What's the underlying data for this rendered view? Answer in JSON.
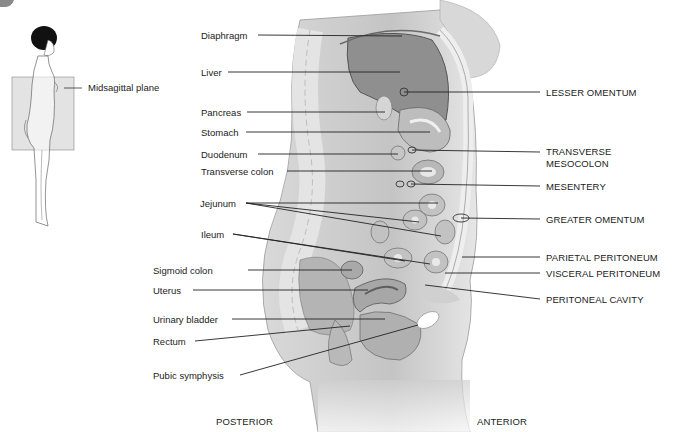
{
  "inset": {
    "label": "Midsagittal plane",
    "plane_color": "#e3e3e3"
  },
  "left_labels": {
    "diaphragm": "Diaphragm",
    "liver": "Liver",
    "pancreas": "Pancreas",
    "stomach": "Stomach",
    "duodenum": "Duodenum",
    "transverse_colon": "Transverse colon",
    "jejunum": "Jejunum",
    "ileum": "Ileum",
    "sigmoid_colon": "Sigmoid colon",
    "uterus": "Uterus",
    "urinary_bladder": "Urinary bladder",
    "rectum": "Rectum",
    "pubic_symphysis": "Pubic symphysis"
  },
  "right_labels": {
    "lesser_omentum": "LESSER OMENTUM",
    "transverse_mesocolon_1": "TRANSVERSE",
    "transverse_mesocolon_2": "MESOCOLON",
    "mesentery": "MESENTERY",
    "greater_omentum": "GREATER OMENTUM",
    "parietal_peritoneum": "PARIETAL PERITONEUM",
    "visceral_peritoneum": "VISCERAL PERITONEUM",
    "peritoneal_cavity": "PERITONEAL CAVITY"
  },
  "orientation": {
    "posterior": "POSTERIOR",
    "anterior": "ANTERIOR"
  }
}
